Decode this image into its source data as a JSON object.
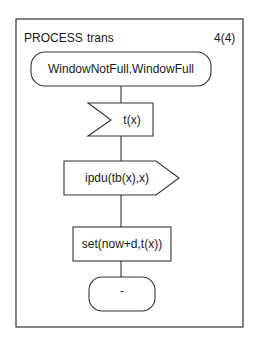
{
  "diagram": {
    "type": "SDL process diagram",
    "header": {
      "keyword": "PROCESS",
      "name": "trans",
      "page": "4(4)"
    },
    "nodes": [
      {
        "id": "start_state",
        "kind": "state",
        "label": "WindowNotFull,WindowFull"
      },
      {
        "id": "input_signal",
        "kind": "input",
        "label": "t(x)"
      },
      {
        "id": "output_signal",
        "kind": "output",
        "label": "ipdu(tb(x),x)"
      },
      {
        "id": "task",
        "kind": "task",
        "label": "set(now+d,t(x))"
      },
      {
        "id": "next_state",
        "kind": "state",
        "label": "-"
      }
    ],
    "edges": [
      {
        "from": "start_state",
        "to": "input_signal"
      },
      {
        "from": "input_signal",
        "to": "output_signal"
      },
      {
        "from": "output_signal",
        "to": "task"
      },
      {
        "from": "task",
        "to": "next_state"
      }
    ],
    "colors": {
      "stroke": "#333333",
      "text": "#1a1a1a",
      "background": "#ffffff"
    }
  }
}
